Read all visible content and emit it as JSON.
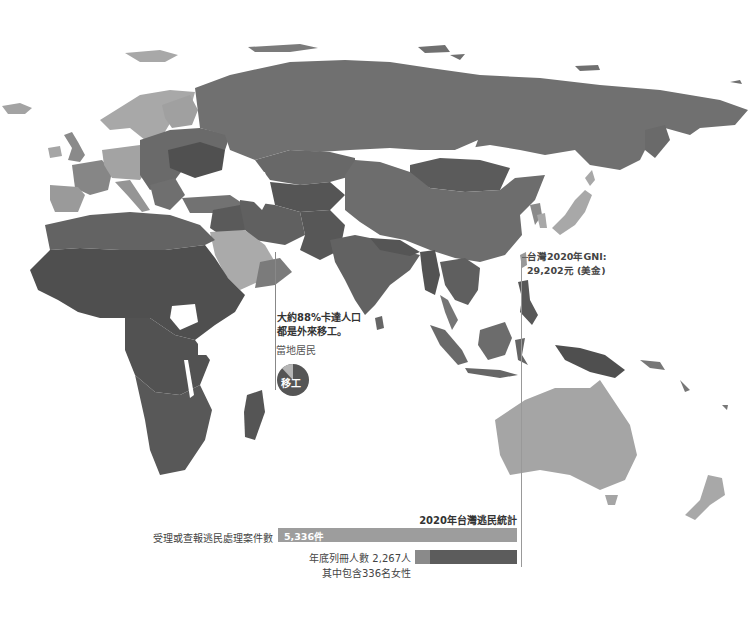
{
  "map": {
    "projection_region": "Europe, Africa, Asia, Oceania",
    "fill_scale": "grayscale (darker = lower GNI)",
    "colors": {
      "lightest": "#b8b8b8",
      "light": "#a3a3a3",
      "mid": "#7b7b7b",
      "dark": "#626262",
      "darkest": "#4f4f4f",
      "water": "#ffffff"
    }
  },
  "annotations": {
    "qatar": {
      "line1": "大約88%卡達人口",
      "line2": "都是外來移工。",
      "pie": {
        "local_label": "當地居民",
        "migrant_label": "移工",
        "migrant_share": 0.88,
        "local_share": 0.12,
        "migrant_color": "#555555",
        "local_color": "#b5b5b5"
      }
    },
    "taiwan": {
      "line1": "台灣2020年GNI:",
      "line2": "29,202元 (美金)"
    }
  },
  "stats": {
    "title": "2020年台灣逃民統計",
    "bars": [
      {
        "label": "受理或查報逃民處理案件數",
        "value_label": "5,336件",
        "value": 5336,
        "color": "#9d9d9d"
      },
      {
        "label": "年底列冊人數 2,267人",
        "sub_label": "其中包含336名女性",
        "value": 2267,
        "women": 336,
        "color": "#5c5c5c",
        "women_color": "#8a8a8a"
      }
    ]
  }
}
